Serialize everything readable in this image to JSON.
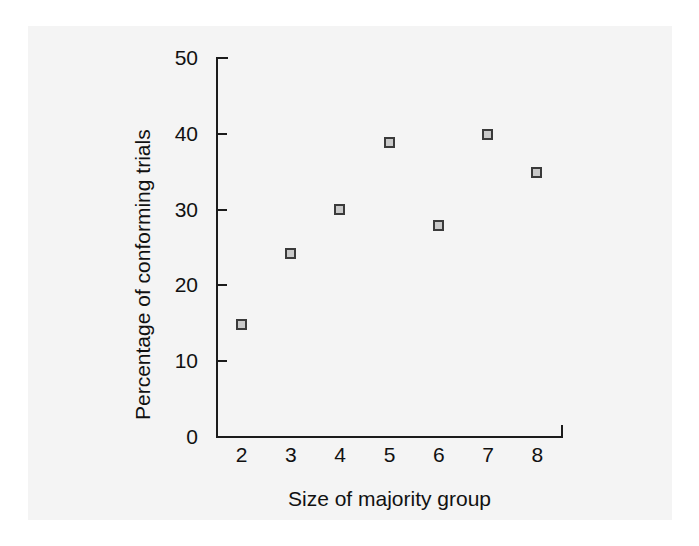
{
  "figure": {
    "background_color": "#ffffff",
    "panel_color": "#f4f4f4",
    "axis_color": "#1b1b1b",
    "marker_fill": "#c9c9c9",
    "marker_edge": "#3a3a3a"
  },
  "chart_data": {
    "type": "scatter",
    "title": "",
    "xlabel": "Size of majority group",
    "ylabel": "Percentage of conforming trials",
    "x": [
      2,
      3,
      4,
      5,
      6,
      7,
      8
    ],
    "values": [
      14.8,
      24.2,
      30.0,
      38.8,
      27.9,
      39.8,
      34.8
    ],
    "series": [
      {
        "name": "Percentage of conforming trials",
        "x": [
          2,
          3,
          4,
          5,
          6,
          7,
          8
        ],
        "values": [
          14.8,
          24.2,
          30.0,
          38.8,
          27.9,
          39.8,
          34.8
        ]
      }
    ],
    "xlim": [
      1.5,
      8.5
    ],
    "ylim": [
      0,
      50
    ],
    "yticks": [
      0,
      10,
      20,
      30,
      40,
      50
    ],
    "ytick_labels": [
      "0",
      "10",
      "20",
      "30",
      "40",
      "50"
    ],
    "xticks": [
      2,
      3,
      4,
      5,
      6,
      7,
      8
    ],
    "xtick_labels": [
      "2",
      "3",
      "4",
      "5",
      "6",
      "7",
      "8"
    ],
    "grid": false,
    "legend": null,
    "marker": "square"
  }
}
